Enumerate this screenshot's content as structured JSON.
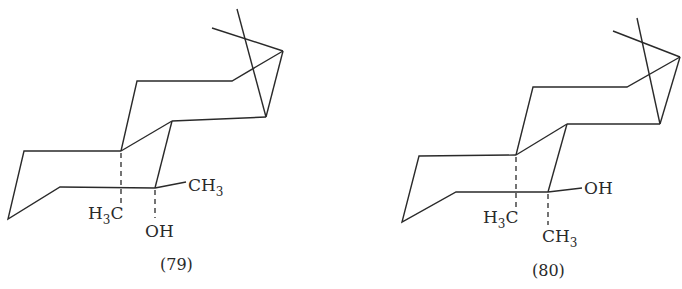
{
  "figure": {
    "structures": [
      {
        "id": "79",
        "caption": "(79)",
        "labels": {
          "methyl_top": {
            "main": "CH",
            "sub": "3"
          },
          "hydroxyl": {
            "main": "OH"
          },
          "angular_methyl": {
            "pre": "H",
            "sub": "3",
            "post": "C"
          }
        }
      },
      {
        "id": "80",
        "caption": "(80)",
        "labels": {
          "hydroxyl": {
            "main": "OH"
          },
          "methyl_bottom": {
            "main": "CH",
            "sub": "3"
          },
          "angular_methyl": {
            "pre": "H",
            "sub": "3",
            "post": "C"
          }
        }
      }
    ],
    "stroke_color": "#2a2a2a",
    "background": "#ffffff"
  }
}
